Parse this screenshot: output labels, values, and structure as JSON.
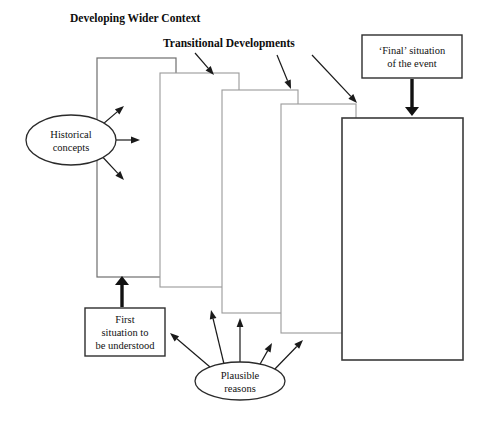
{
  "diagram": {
    "title": "Developing Wider Context",
    "headings": [
      {
        "id": "developing-wider-context",
        "label": "Developing Wider Context",
        "x": 70,
        "y": 22
      },
      {
        "id": "transitional-developments",
        "label": "Transitional Developments",
        "x": 163,
        "y": 47
      }
    ],
    "stack": {
      "count": 5,
      "fill": "#ffffff",
      "light_stroke": "#8a8a8a",
      "dark_stroke": "#3a3a3a",
      "rects": [
        {
          "id": "stage-1",
          "x": 97,
          "y": 58,
          "w": 79,
          "h": 219,
          "stroke": "#6e6e6e",
          "stroke_width": 1.2
        },
        {
          "id": "stage-2",
          "x": 160,
          "y": 73,
          "w": 79,
          "h": 214,
          "stroke": "#9a9a9a",
          "stroke_width": 1.1
        },
        {
          "id": "stage-3",
          "x": 222,
          "y": 90,
          "w": 76,
          "h": 223,
          "stroke": "#9a9a9a",
          "stroke_width": 1.1
        },
        {
          "id": "stage-4",
          "x": 281,
          "y": 104,
          "w": 75,
          "h": 229,
          "stroke": "#9a9a9a",
          "stroke_width": 1.1
        },
        {
          "id": "stage-5",
          "x": 342,
          "y": 118,
          "w": 121,
          "h": 242,
          "stroke": "#3a3a3a",
          "stroke_width": 1.6
        }
      ]
    },
    "boxes": [
      {
        "id": "final-situation",
        "lines": [
          "‘Final’ situation",
          "of the event"
        ],
        "x": 362,
        "y": 35,
        "w": 100,
        "h": 43
      },
      {
        "id": "first-situation",
        "lines": [
          "First",
          "situation to",
          "be understood"
        ],
        "x": 85,
        "y": 308,
        "w": 80,
        "h": 48
      }
    ],
    "ellipses": [
      {
        "id": "historical-concepts",
        "lines": [
          "Historical",
          "concepts"
        ],
        "cx": 71,
        "cy": 140,
        "rx": 45,
        "ry": 25
      },
      {
        "id": "plausible-reasons",
        "lines": [
          "Plausible",
          "reasons"
        ],
        "cx": 240,
        "cy": 381,
        "rx": 45,
        "ry": 19
      }
    ],
    "thick_arrows": [
      {
        "id": "final-to-stage5",
        "x1": 412,
        "y1": 79,
        "x2": 412,
        "y2": 116,
        "width": 3.4,
        "head": 9
      },
      {
        "id": "first-to-stage1",
        "x1": 122,
        "y1": 307,
        "x2": 122,
        "y2": 276,
        "width": 3.4,
        "head": 9
      }
    ],
    "thin_arrows": [
      {
        "id": "transitional-to-stage2",
        "x1": 195,
        "y1": 53,
        "x2": 214,
        "y2": 75
      },
      {
        "id": "transitional-to-stage3",
        "x1": 277,
        "y1": 55,
        "x2": 291,
        "y2": 89
      },
      {
        "id": "transitional-to-stage4",
        "x1": 312,
        "y1": 55,
        "x2": 357,
        "y2": 103
      },
      {
        "id": "historical-up",
        "x1": 96,
        "y1": 130,
        "x2": 124,
        "y2": 106
      },
      {
        "id": "historical-right",
        "x1": 104,
        "y1": 140,
        "x2": 140,
        "y2": 140
      },
      {
        "id": "historical-down",
        "x1": 98,
        "y1": 152,
        "x2": 124,
        "y2": 180
      },
      {
        "id": "plausible-far-left",
        "x1": 210,
        "y1": 367,
        "x2": 170,
        "y2": 333
      },
      {
        "id": "plausible-left",
        "x1": 224,
        "y1": 364,
        "x2": 211,
        "y2": 310
      },
      {
        "id": "plausible-up",
        "x1": 240,
        "y1": 362,
        "x2": 240,
        "y2": 318
      },
      {
        "id": "plausible-right",
        "x1": 259,
        "y1": 366,
        "x2": 272,
        "y2": 343
      },
      {
        "id": "plausible-far-right",
        "x1": 272,
        "y1": 372,
        "x2": 303,
        "y2": 340
      }
    ]
  }
}
